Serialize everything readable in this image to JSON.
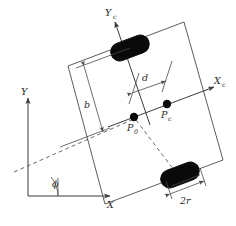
{
  "figure": {
    "type": "kinematics-diagram",
    "background_color": "#ffffff",
    "line_color": "#4a4a4a",
    "wheel_color": "#0a0a0a"
  },
  "labels": {
    "global_x": "X",
    "global_y": "Y",
    "body_x": "X",
    "body_x_sub": "c",
    "body_y": "Y",
    "body_y_sub": "c",
    "angle": "ϕ",
    "origin_point": "P",
    "origin_point_sub": "0",
    "control_point": "P",
    "control_point_sub": "c",
    "wheelbase": "b",
    "offset": "d",
    "wheel_width": "2r"
  },
  "geometry": {
    "body_angle_deg": -21,
    "body_corners": [
      {
        "x": 68,
        "y": 66
      },
      {
        "x": 184,
        "y": 22
      },
      {
        "x": 223,
        "y": 160
      },
      {
        "x": 105,
        "y": 204
      }
    ],
    "point_P0": {
      "x": 134,
      "y": 117
    },
    "point_Pc": {
      "x": 167,
      "y": 104
    },
    "wheel_top": {
      "x": 130,
      "y": 48,
      "w": 40,
      "h": 18
    },
    "wheel_bottom": {
      "x": 180,
      "y": 175,
      "w": 40,
      "h": 18
    },
    "global_origin": {
      "x": 28,
      "y": 196
    },
    "global_x_end": {
      "x": 112,
      "y": 196
    },
    "global_y_end": {
      "x": 28,
      "y": 96
    }
  }
}
